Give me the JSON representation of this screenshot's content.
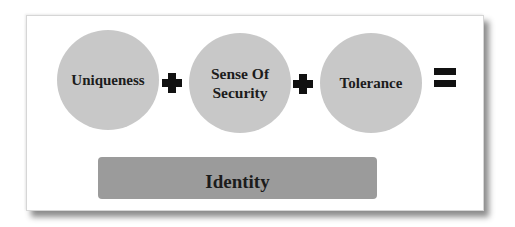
{
  "diagram": {
    "terms": [
      {
        "label": "Uniqueness"
      },
      {
        "label": "Sense Of Security"
      },
      {
        "label": "Tolerance"
      }
    ],
    "operators": [
      "+",
      "+",
      "="
    ],
    "result": {
      "label": "Identity"
    },
    "colors": {
      "circle_fill": "#c8c8c8",
      "result_fill": "#9b9b9b",
      "text": "#1c1c1c",
      "operator": "#111111"
    }
  }
}
